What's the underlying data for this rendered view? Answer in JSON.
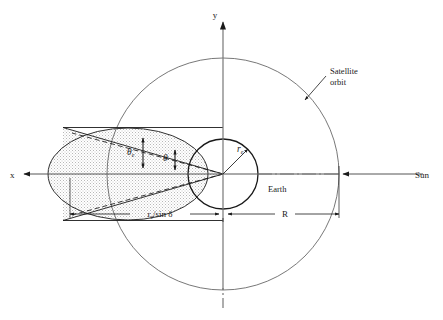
{
  "figure": {
    "background_color": "#ffffff",
    "line_color": "#1a1a1a",
    "thin_line_color": "#555555",
    "shadow_fill_color": "#d9d9d9",
    "width": 443,
    "height": 320
  },
  "axes": {
    "y_label": "y",
    "x_label": "x",
    "origin_label": ""
  },
  "labels": {
    "satellite_orbit_line1": "Satellite",
    "satellite_orbit_line2": "orbit",
    "earth": "Earth",
    "sun": "Sun",
    "earth_radius_symbol": "r",
    "earth_radius_subscript": "e",
    "angle_theta_e_symbol": "θ",
    "angle_theta_e_subscript": "e",
    "angle_theta_symbol": "θ"
  },
  "dimensions": [
    {
      "name": "shadow-length",
      "symbol_numerator": "r",
      "symbol_subscript": "e",
      "symbol_rest": "/sin δ",
      "full_text": "rₑ/sin δ"
    },
    {
      "name": "orbit-radius",
      "full_text": "R"
    }
  ],
  "geometry_data": {
    "type": "technical-diagram",
    "orbit_circle": {
      "cx": 223,
      "cy": 174,
      "r": 116
    },
    "earth_circle": {
      "cx": 223,
      "cy": 174,
      "r": 35
    },
    "shadow_ellipse": {
      "cx": 128,
      "cy": 174,
      "rx": 80,
      "ry": 46
    },
    "shadow_cone_apex": {
      "x": 223,
      "y": 174
    },
    "shadow_cone_upper_end": {
      "x": 63,
      "y": 128
    },
    "shadow_cone_lower_end": {
      "x": 63,
      "y": 220
    },
    "x_axis": {
      "x1": 20,
      "y1": 174,
      "x2": 423,
      "y2": 174
    },
    "y_axis": {
      "x1": 223,
      "y1": 290,
      "x2": 223,
      "y2": 18
    },
    "dimension_line_y": 214,
    "dim_shadow_span": {
      "x1": 70,
      "x2": 219
    },
    "dim_R_span": {
      "x1": 228,
      "x2": 339
    }
  }
}
